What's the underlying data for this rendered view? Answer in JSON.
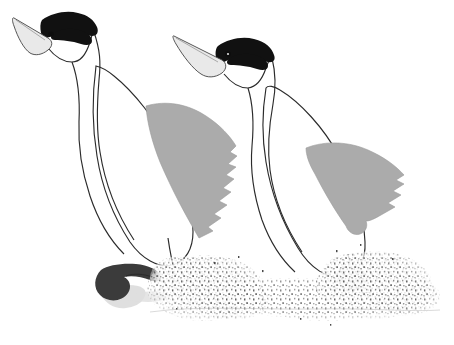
{
  "artwork": {
    "title": "Two water birds running across water",
    "subject": "grebes",
    "style": "line drawing with grayscale fills",
    "background_color": "#ffffff",
    "canvas": {
      "width": 454,
      "height": 345
    }
  },
  "palette": {
    "background": "#ffffff",
    "outline": "#2b2b2b",
    "body_fill": "#ffffff",
    "beak_fill": "#e9e9e9",
    "head_patch": "#111111",
    "wing_gray": "#ababab",
    "foot_dark": "#3b3b3b",
    "shadow_gray": "#d3d3d3",
    "splash_dot": "#4a4a4a"
  },
  "birds": [
    {
      "id": "bird-left",
      "label": "Left bird",
      "parts": {
        "beak": "light gray pointed beak angled up-left",
        "head_patch": "black crown and eye stripe",
        "eye": "black eye dot",
        "neck": "long slender S-curved neck",
        "body": "white oval body",
        "wing": "gray wing with serrated trailing edge",
        "foot": "dark webbed foot lifted behind",
        "shadow": "soft gray reflection under foot",
        "splash": "stippled water spray at footfall"
      }
    },
    {
      "id": "bird-right",
      "label": "Right bird",
      "parts": {
        "beak": "light gray pointed beak angled up-left",
        "head_patch": "black crown and eye stripe",
        "eye": "black eye dot",
        "neck": "long slender S-curved neck",
        "body": "white oval body",
        "wing": "gray wing with serrated trailing edge",
        "foot": "dark webbed foot planted on water",
        "splash": "stippled water spray at footfall"
      }
    }
  ],
  "water": {
    "label": "Water surface with splashing spray",
    "splash_fields": [
      {
        "id": "splash-left",
        "label": "Left splash plume"
      },
      {
        "id": "splash-right",
        "label": "Right splash plume"
      },
      {
        "id": "splash-center",
        "label": "Central water spray band"
      }
    ]
  }
}
